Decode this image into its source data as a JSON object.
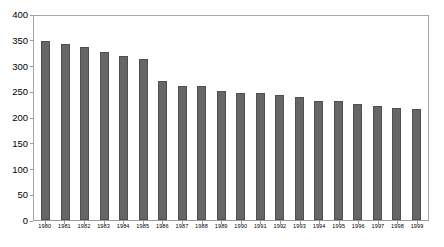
{
  "chart_data": {
    "type": "bar",
    "title": "",
    "xlabel": "",
    "ylabel": "",
    "ylim": [
      0,
      400
    ],
    "ytick_step": 50,
    "yticks": [
      "0",
      "50",
      "100",
      "150",
      "200",
      "250",
      "300",
      "350",
      "400"
    ],
    "grid": false,
    "legend": null,
    "bar_color": "#666666",
    "bar_edge_color": "#4f4f4f",
    "axis_color": "#a6a6a6",
    "categories": [
      "1980",
      "1981",
      "1982",
      "1983",
      "1984",
      "1985",
      "1986",
      "1987",
      "1988",
      "1989",
      "1990",
      "1991",
      "1992",
      "1993",
      "1994",
      "1995",
      "1996",
      "1997",
      "1998",
      "1999"
    ],
    "values": [
      349,
      343,
      338,
      328,
      321,
      315,
      272,
      261,
      261,
      252,
      248,
      248,
      243,
      240,
      232,
      232,
      226,
      222,
      218,
      217
    ]
  }
}
